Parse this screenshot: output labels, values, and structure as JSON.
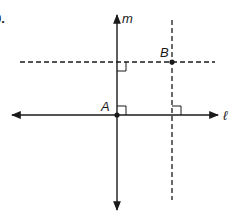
{
  "problem": {
    "number_label": "9."
  },
  "labels": {
    "line_m": "m",
    "line_l": "ℓ",
    "point_a": "A",
    "point_b": "B"
  },
  "colors": {
    "ink": "#1a1a1a",
    "background": "#ffffff"
  },
  "geometry": {
    "line_m": {
      "style": "solid",
      "x": 117,
      "y_top": 15,
      "y_bottom": 210,
      "arrows": "both"
    },
    "line_l": {
      "style": "solid",
      "y": 115,
      "x_left": 12,
      "x_right": 218,
      "arrows": "both"
    },
    "dashed_horizontal": {
      "style": "dashed",
      "y": 62,
      "x_left": 20,
      "x_right": 215
    },
    "dashed_vertical": {
      "style": "dashed",
      "x": 172,
      "y_top": 20,
      "y_bottom": 200
    },
    "point_a": {
      "x": 117,
      "y": 115
    },
    "point_b": {
      "x": 172,
      "y": 62
    },
    "right_angle_marks": [
      {
        "at": "m ∩ dashed horizontal",
        "x": 117,
        "y": 62
      },
      {
        "at": "A (m ∩ ℓ)",
        "x": 117,
        "y": 115
      },
      {
        "at": "ℓ ∩ dashed vertical",
        "x": 172,
        "y": 115
      }
    ]
  }
}
